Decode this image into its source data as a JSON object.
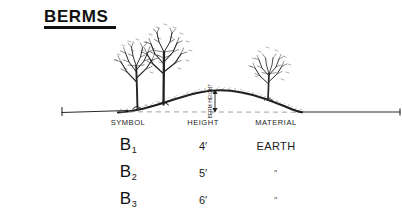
{
  "sheet": {
    "title": "BERMS",
    "background_color": "#ffffff",
    "ink_color": "#1a1a1a"
  },
  "drawing": {
    "berm_height_label": "BERM HEIGHT",
    "existing_grade_label": "",
    "elements": {
      "left_tree_label": "tree",
      "center_tree_label": "tree",
      "right_tree_label": "shrub",
      "ground_line_label": "existing grade line",
      "berm_profile_label": "berm mound profile",
      "dimension_arrow_label": "berm height dimension"
    }
  },
  "legend": {
    "headers": [
      "SYMBOL",
      "HEIGHT",
      "MATERIAL"
    ],
    "rows": [
      {
        "symbol_base": "B",
        "symbol_sub": "1",
        "height": "4′",
        "material": "EARTH"
      },
      {
        "symbol_base": "B",
        "symbol_sub": "2",
        "height": "5′",
        "material": "″"
      },
      {
        "symbol_base": "B",
        "symbol_sub": "3",
        "height": "6′",
        "material": "″"
      }
    ]
  }
}
